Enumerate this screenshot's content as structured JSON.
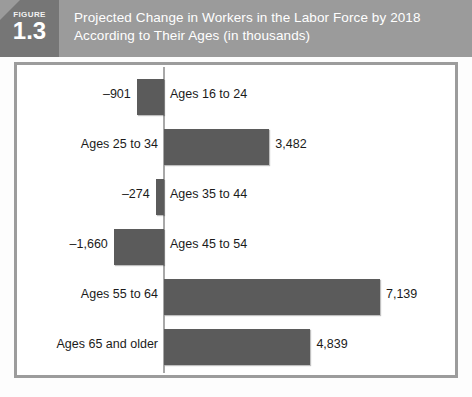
{
  "figure": {
    "word": "FIGURE",
    "number": "1.3"
  },
  "header": {
    "title_line1": "Projected Change in Workers in the Labor Force by 2018",
    "title_line2": "According to Their Ages (in thousands)",
    "bar_color": "#9b9b9b",
    "badge_color": "#767676"
  },
  "chart_data": {
    "type": "bar",
    "orientation": "horizontal",
    "title": "Projected Change in Workers in the Labor Force by 2018 According to Their Ages (in thousands)",
    "xlabel": "",
    "ylabel": "",
    "units": "thousands",
    "grid": false,
    "legend": "none",
    "xlim": [
      -1660,
      7139
    ],
    "categories": [
      "Ages 16 to 24",
      "Ages 25 to 34",
      "Ages 35 to 44",
      "Ages 45 to 54",
      "Ages 55 to 64",
      "Ages 65 and older"
    ],
    "values": [
      -901,
      3482,
      -274,
      -1660,
      7139,
      4839
    ],
    "value_labels": [
      "–901",
      "3,482",
      "–274",
      "–1,660",
      "7,139",
      "4,839"
    ],
    "bar_color": "#5b5b5b",
    "axis_color": "#a8a8a8",
    "zero_line": 0
  },
  "bars": [
    {
      "label": "Ages 16 to 24",
      "value_label": "–901",
      "value": -901,
      "label_side": "right",
      "value_side": "left"
    },
    {
      "label": "Ages 25 to 34",
      "value_label": "3,482",
      "value": 3482,
      "label_side": "left",
      "value_side": "right"
    },
    {
      "label": "Ages 35 to 44",
      "value_label": "–274",
      "value": -274,
      "label_side": "right",
      "value_side": "left"
    },
    {
      "label": "Ages 45 to 54",
      "value_label": "–1,660",
      "value": -1660,
      "label_side": "right",
      "value_side": "left"
    },
    {
      "label": "Ages 55 to 64",
      "value_label": "7,139",
      "value": 7139,
      "label_side": "left",
      "value_side": "right"
    },
    {
      "label": "Ages 65 and older",
      "value_label": "4,839",
      "value": 4839,
      "label_side": "left",
      "value_side": "right"
    }
  ]
}
